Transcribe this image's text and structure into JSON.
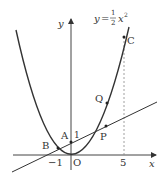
{
  "diagram": {
    "type": "coordinate-graph",
    "curve_label": {
      "lhs": "y",
      "eq": "=",
      "num": "1",
      "den": "2",
      "rhs": "x",
      "exp": "2"
    },
    "axes": {
      "x_label": "x",
      "y_label": "y",
      "origin_label": "O"
    },
    "tick_labels": {
      "x_neg1": "−1",
      "x_5": "5",
      "y_1": "1"
    },
    "points": {
      "A": "A",
      "B": "B",
      "C": "C",
      "P": "P",
      "Q": "Q"
    },
    "colors": {
      "stroke": "#333333",
      "axis": "#555555",
      "dashed": "#888888"
    }
  }
}
